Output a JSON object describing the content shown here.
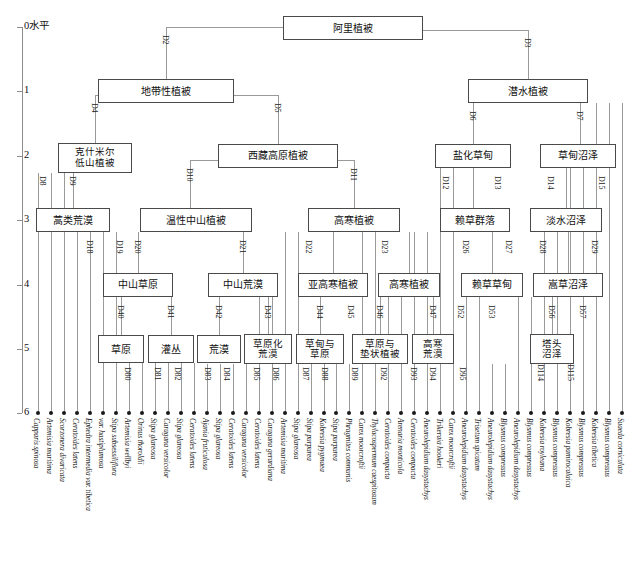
{
  "chart_data": {
    "type": "diagram",
    "ylabel": "0水平",
    "axis": {
      "label_top": "0水平",
      "ticks": [
        "0水平",
        "1",
        "2",
        "3",
        "4",
        "5",
        "6"
      ],
      "range": [
        0,
        6
      ]
    }
  },
  "axis": {
    "top_label": "0水平",
    "ticks": [
      {
        "text": "0水平",
        "value": 0
      },
      {
        "text": "1",
        "value": 1
      },
      {
        "text": "2",
        "value": 2
      },
      {
        "text": "3",
        "value": 3
      },
      {
        "text": "4",
        "value": 4
      },
      {
        "text": "5",
        "value": 5
      },
      {
        "text": "6",
        "value": 6
      }
    ]
  },
  "nodes": {
    "root": "阿里植被",
    "zonal": "地带性植被",
    "aquatic": "潜水植被",
    "kashmir": "克什米尔\n低山植被",
    "tibet_plateau": "西藏高原植被",
    "saline_meadow": "盐化草甸",
    "meadow_swamp": "草甸沼泽",
    "artemisia_desert": "蒿类荒漠",
    "warm_mid_mountain": "温性中山植被",
    "alpine_veg": "高寒植被",
    "leymus_community": "赖草群落",
    "freshwater_swamp": "淡水沼泽",
    "mid_mountain_steppe": "中山草原",
    "mid_mountain_desert": "中山荒漠",
    "subalpine_veg": "亚高寒植被",
    "alpine_veg2": "高寒植被",
    "leymus_meadow": "赖草草甸",
    "kobresia_swamp": "嵩草沼泽",
    "steppe": "草原",
    "shrub": "灌丛",
    "desert": "荒漠",
    "steppified_desert": "草原化\n荒漠",
    "meadow_and_steppe": "草甸与\n草原",
    "steppe_and_cushion": "草原与\n垫状植被",
    "alpine_desert": "高寒\n荒漠",
    "hummock_swamp": "塔头\n沼泽"
  },
  "edge_codes": [
    "D2",
    "D3",
    "D4",
    "D5",
    "D6",
    "D7",
    "D8",
    "D9",
    "D10",
    "D11",
    "D12",
    "D13",
    "D14",
    "D15",
    "D18",
    "D19",
    "D20",
    "D21",
    "D22",
    "D23",
    "D26",
    "D27",
    "D28",
    "D29",
    "D40",
    "D41",
    "D42",
    "D43",
    "D44",
    "D45",
    "D46",
    "D47",
    "D52",
    "D53",
    "D56",
    "D57",
    "D80",
    "D81",
    "D82",
    "D83",
    "D84",
    "D85",
    "D86",
    "D87",
    "D88",
    "D89",
    "D92",
    "D93",
    "D94",
    "D95",
    "D114",
    "D115"
  ],
  "leaves": [
    {
      "code": "",
      "name": "Capparis spinosa"
    },
    {
      "code": "",
      "name": "Artemisia maritima"
    },
    {
      "code": "",
      "name": "Scorzonera divaricata"
    },
    {
      "code": "",
      "name": "Ceratoides latens"
    },
    {
      "code": "",
      "name": "Ephedra intermedia var. tibetica"
    },
    {
      "code": "",
      "name": "var. hastiplumosa"
    },
    {
      "code": "",
      "name": "Stipa subsessiliflora"
    },
    {
      "code": "D80",
      "name": "Artemisia wellbyi"
    },
    {
      "code": "D81",
      "name": "Orinus thoroldii"
    },
    {
      "code": "D82",
      "name": "Stipa glareosa"
    },
    {
      "code": "D83",
      "name": "Caragana versicolor"
    },
    {
      "code": "D84",
      "name": "Stipa glareosa"
    },
    {
      "code": "D85",
      "name": "Ceratoides latens"
    },
    {
      "code": "D86",
      "name": "Ajania fruticulosa"
    },
    {
      "code": "D87",
      "name": "Stipa glareosa"
    },
    {
      "code": "D88",
      "name": "Ceratoides latens"
    },
    {
      "code": "D89",
      "name": "Caragana versicolor"
    },
    {
      "code": "",
      "name": "Ceratoides latens"
    },
    {
      "code": "",
      "name": "Caragana gerardiana"
    },
    {
      "code": "",
      "name": "Artemisia maritima"
    },
    {
      "code": "",
      "name": "Stipa glareosa"
    },
    {
      "code": "",
      "name": "Stipa purpurea"
    },
    {
      "code": "",
      "name": "Kobresia pygmaea"
    },
    {
      "code": "",
      "name": "Stipa purpurea"
    },
    {
      "code": "D92",
      "name": "Phragmites communis"
    },
    {
      "code": "D93",
      "name": "Carex moorcroftii"
    },
    {
      "code": "D94",
      "name": "Thylacospermum caespitosum"
    },
    {
      "code": "D95",
      "name": "Ceratoides compacta"
    },
    {
      "code": "",
      "name": "Arenaria monticola"
    },
    {
      "code": "",
      "name": "Ceratoides compacta"
    },
    {
      "code": "",
      "name": "Aneurolepidium dasystachys"
    },
    {
      "code": "",
      "name": "Trikeraia hookeri"
    },
    {
      "code": "",
      "name": "Carex moorcroftii"
    },
    {
      "code": "",
      "name": "Aneurolepidium dasystachys"
    },
    {
      "code": "",
      "name": "Trisetum spicatum"
    },
    {
      "code": "",
      "name": "Aneurolepidium dasystachys"
    },
    {
      "code": "",
      "name": "Blysmus compressus"
    },
    {
      "code": "",
      "name": "Aneurolepidium dasystachys"
    },
    {
      "code": "",
      "name": "Blysmus compressus"
    },
    {
      "code": "D114",
      "name": "Kobresia royleana"
    },
    {
      "code": "D115",
      "name": "Blysmus compressus"
    },
    {
      "code": "",
      "name": "Kobresia pamirocalaica"
    },
    {
      "code": "",
      "name": "Blysmus compressus"
    },
    {
      "code": "",
      "name": "Kobresia tibetica"
    },
    {
      "code": "",
      "name": "Blysmus compressus"
    },
    {
      "code": "",
      "name": "Suaeda corniculata"
    }
  ],
  "colors": {
    "box_border": "#4a4a4a",
    "connector": "#9a9a9a",
    "axis": "#8d8d8d",
    "text": "#111111",
    "leaf_dot": "#1a1a1a",
    "background": "#ffffff"
  }
}
